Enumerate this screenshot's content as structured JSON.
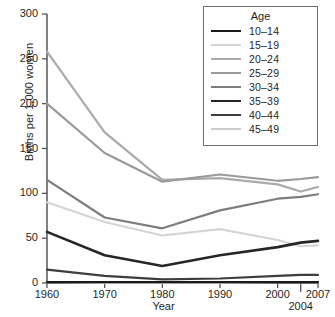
{
  "chart_data": {
    "type": "line",
    "title": "",
    "xlabel": "Year",
    "ylabel": "Births per 1,000 women",
    "x": [
      1960,
      1970,
      1980,
      1990,
      2000,
      2004,
      2007
    ],
    "xtick_labels": [
      "1960",
      "1970",
      "1980",
      "1990",
      "2000",
      "2004",
      "2007"
    ],
    "ytick_labels": [
      "0",
      "50",
      "100",
      "150",
      "200",
      "250",
      "300"
    ],
    "yticks": [
      0,
      50,
      100,
      150,
      200,
      250,
      300
    ],
    "ylim": [
      0,
      300
    ],
    "xlim": [
      1960,
      2007
    ],
    "grid": false,
    "legend_title": "Age",
    "legend_position": "top-right",
    "series": [
      {
        "name": "10–14",
        "color": "#1a1a1a",
        "width": 2.2,
        "values": [
          1,
          1,
          1,
          1,
          1,
          1,
          1
        ]
      },
      {
        "name": "15–19",
        "color": "#d4d4d4",
        "width": 2.2,
        "values": [
          90,
          68,
          53,
          60,
          48,
          41,
          42
        ]
      },
      {
        "name": "20–24",
        "color": "#aaaaaa",
        "width": 2.2,
        "values": [
          258,
          168,
          115,
          117,
          110,
          102,
          107
        ]
      },
      {
        "name": "25–29",
        "color": "#9a9a9a",
        "width": 2.2,
        "values": [
          200,
          145,
          113,
          121,
          114,
          116,
          118
        ]
      },
      {
        "name": "30–34",
        "color": "#7d7d7d",
        "width": 2.2,
        "values": [
          115,
          73,
          61,
          81,
          94,
          96,
          99
        ]
      },
      {
        "name": "35–39",
        "color": "#262626",
        "width": 2.6,
        "values": [
          57,
          31,
          19,
          31,
          40,
          45,
          47
        ]
      },
      {
        "name": "40–44",
        "color": "#3d3d3d",
        "width": 2.2,
        "values": [
          15,
          8,
          4,
          5,
          8,
          9,
          9
        ]
      },
      {
        "name": "45–49",
        "color": "#cccccc",
        "width": 2.2,
        "values": [
          1,
          0,
          0,
          0,
          1,
          1,
          1
        ]
      }
    ]
  },
  "axis": {
    "y_title": "Births per 1,000 women",
    "x_title": "Year"
  }
}
